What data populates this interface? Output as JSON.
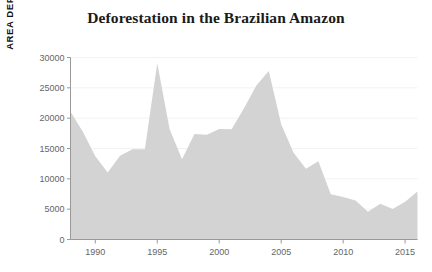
{
  "chart_data": {
    "type": "area",
    "title": "Deforestation in the Brazilian Amazon",
    "xlabel": "",
    "ylabel": "AREA DEFORESTED, IN SQ KM",
    "xlim": [
      1988,
      2016
    ],
    "ylim": [
      0,
      30000
    ],
    "grid": true,
    "legend": "none",
    "fill_color": "#d3d3d3",
    "background_color": "#ffffff",
    "title_color": "#1a1a1a",
    "tick_color": "#666666",
    "axis_color": "#999999",
    "y_ticks": [
      0,
      5000,
      10000,
      15000,
      20000,
      25000,
      30000
    ],
    "y_tick_labels": [
      "0",
      "5000",
      "10000",
      "15000",
      "20000",
      "25000",
      "30000"
    ],
    "x_ticks": [
      1990,
      1995,
      2000,
      2005,
      2010,
      2015
    ],
    "x_tick_labels": [
      "1990",
      "1995",
      "2000",
      "2005",
      "2010",
      "2015"
    ],
    "x": [
      1988,
      1989,
      1990,
      1991,
      1992,
      1993,
      1994,
      1995,
      1996,
      1997,
      1998,
      1999,
      2000,
      2001,
      2002,
      2003,
      2004,
      2005,
      2006,
      2007,
      2008,
      2009,
      2010,
      2011,
      2012,
      2013,
      2014,
      2015,
      2016
    ],
    "values": [
      21050,
      17770,
      13730,
      11030,
      13786,
      14896,
      14896,
      29059,
      18161,
      13227,
      17383,
      17259,
      18226,
      18165,
      21651,
      25396,
      27772,
      19014,
      14286,
      11651,
      12911,
      7464,
      7000,
      6418,
      4571,
      5891,
      5012,
      6207,
      7893
    ]
  }
}
